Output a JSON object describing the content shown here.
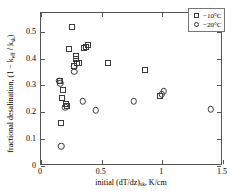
{
  "chart_data": {
    "type": "scatter",
    "title": "",
    "xlabel": "initial (dT/dz)sk, K/cm",
    "ylabel": "fractional desalination, (1 − keff / ksk)",
    "xlim": [
      0,
      1.5
    ],
    "ylim": [
      0,
      0.57
    ],
    "grid": false,
    "legend_position": "top-right",
    "xticks": [
      "0",
      "0.5",
      "1",
      "1.5"
    ],
    "xtick_values": [
      0,
      0.5,
      1,
      1.5
    ],
    "yticks": [
      "0",
      "0.1",
      "0.2",
      "0.3",
      "0.4",
      "0.5"
    ],
    "ytick_values": [
      0,
      0.1,
      0.2,
      0.3,
      0.4,
      0.5
    ],
    "series": [
      {
        "name": "−10°C",
        "marker": "square",
        "color": "#3a3a3a",
        "points": [
          [
            0.155,
            0.315
          ],
          [
            0.163,
            0.162
          ],
          [
            0.172,
            0.255
          ],
          [
            0.185,
            0.285
          ],
          [
            0.205,
            0.232
          ],
          [
            0.212,
            0.222
          ],
          [
            0.232,
            0.435
          ],
          [
            0.258,
            0.518
          ],
          [
            0.272,
            0.372
          ],
          [
            0.285,
            0.398
          ],
          [
            0.292,
            0.408
          ],
          [
            0.3,
            0.382
          ],
          [
            0.31,
            0.385
          ],
          [
            0.352,
            0.438
          ],
          [
            0.372,
            0.445
          ],
          [
            0.388,
            0.452
          ],
          [
            0.553,
            0.385
          ],
          [
            0.855,
            0.358
          ],
          [
            0.982,
            0.262
          ]
        ]
      },
      {
        "name": "−20°C",
        "marker": "circle",
        "color": "#3a3a3a",
        "points": [
          [
            0.152,
            0.318
          ],
          [
            0.16,
            0.308
          ],
          [
            0.165,
            0.073
          ],
          [
            0.198,
            0.218
          ],
          [
            0.272,
            0.372
          ],
          [
            0.275,
            0.352
          ],
          [
            0.345,
            0.242
          ],
          [
            0.452,
            0.208
          ],
          [
            0.765,
            0.242
          ],
          [
            0.995,
            0.268
          ],
          [
            1.012,
            0.278
          ],
          [
            1.4,
            0.212
          ]
        ]
      }
    ]
  },
  "legend": {
    "entries": [
      {
        "label": "−10°C",
        "marker": "square"
      },
      {
        "label": "−20°C",
        "marker": "circle"
      }
    ]
  },
  "axes": {
    "x_title_pre": "initial (dT/dz)",
    "x_title_sub": "sk",
    "x_title_post": ", K/cm",
    "y_title_pre": "fractional desalination, (1 − k",
    "y_title_sub1": "eff",
    "y_title_mid": " / k",
    "y_title_sub2": "sk",
    "y_title_post": ")"
  }
}
